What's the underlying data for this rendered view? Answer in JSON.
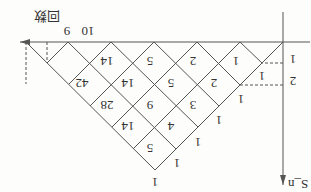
{
  "diagram": {
    "orientation": "rotated-180",
    "x_axis_label": "回数",
    "y_axis_label": "S_n",
    "x_ticks": [
      "9",
      "10"
    ],
    "y_ticks": [
      "1",
      "2"
    ],
    "end_value": "42",
    "cells": {
      "row1": [
        "1",
        "2",
        "5",
        "14"
      ],
      "row2": [
        "1",
        "2",
        "5",
        "14"
      ],
      "row3": [
        "1",
        "3",
        "9",
        "28"
      ],
      "row4": [
        "1",
        "4",
        "14"
      ],
      "row5": [
        "1",
        "5"
      ],
      "row6": [
        "1"
      ]
    },
    "edge_ones": [
      "1",
      "1",
      "1",
      "1",
      "1",
      "1"
    ],
    "colors": {
      "line": "#555555",
      "text": "#333333",
      "background": "#fdfdfb"
    }
  }
}
